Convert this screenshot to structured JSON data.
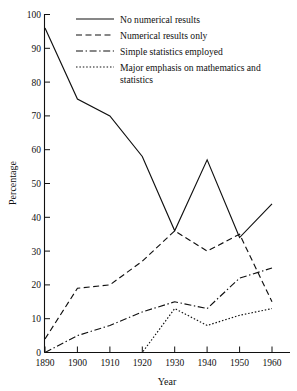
{
  "chart_data": {
    "type": "line",
    "title": "",
    "xlabel": "Year",
    "ylabel": "Percentage",
    "x": [
      1890,
      1900,
      1910,
      1920,
      1930,
      1940,
      1950,
      1960
    ],
    "xlim": [
      1890,
      1965
    ],
    "ylim": [
      0,
      100
    ],
    "xticks": [
      "1890",
      "1900",
      "1910",
      "1920",
      "1930",
      "1940",
      "1950",
      "1960"
    ],
    "yticks": [
      "0",
      "10",
      "20",
      "30",
      "40",
      "50",
      "60",
      "70",
      "80",
      "90",
      "100"
    ],
    "grid": false,
    "legend_position": "top-right",
    "series": [
      {
        "name": "No numerical results",
        "style": "solid",
        "values": [
          96,
          75,
          70,
          58,
          36,
          57,
          34,
          44
        ]
      },
      {
        "name": "Numerical results only",
        "style": "dashed",
        "values": [
          4,
          19,
          20,
          27,
          36,
          30,
          35,
          15
        ]
      },
      {
        "name": "Simple statistics employed",
        "style": "dash-dot",
        "values": [
          0,
          5,
          8,
          12,
          15,
          13,
          22,
          25
        ]
      },
      {
        "name": "Major emphasis on mathematics and statistics",
        "style": "dotted",
        "values": [
          0,
          0,
          0,
          0,
          13,
          8,
          11,
          13
        ]
      }
    ]
  },
  "legend": {
    "entries": [
      {
        "label": "No numerical results",
        "style": "solid"
      },
      {
        "label": "Numerical results only",
        "style": "dashed"
      },
      {
        "label": "Simple statistics employed",
        "style": "dash-dot"
      },
      {
        "label_line1": "Major emphasis on mathematics and",
        "label_line2": "statistics",
        "style": "dotted"
      }
    ]
  },
  "axes": {
    "y_title": "Percentage",
    "x_title": "Year"
  },
  "colors": {
    "ink": "#101010",
    "background": "#ffffff"
  }
}
